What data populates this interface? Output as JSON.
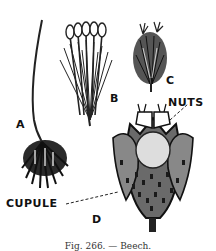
{
  "figure": {
    "caption": "Fig. 266. — Beech.",
    "labels": {
      "a": "A",
      "b": "B",
      "c": "C",
      "d": "D",
      "nuts": "NUTS",
      "cupule": "CUPULE"
    },
    "parts": [
      {
        "id": "A",
        "description": "staminate (male) flower cluster on long stalk"
      },
      {
        "id": "B",
        "description": "single staminate flower with stamens"
      },
      {
        "id": "C",
        "description": "pistillate (female) flower"
      },
      {
        "id": "D",
        "description": "fruit: spiny cupule opening to show nuts"
      }
    ]
  }
}
